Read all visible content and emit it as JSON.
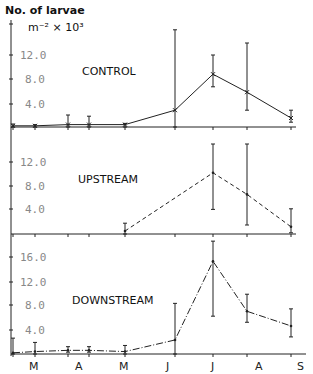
{
  "chart_data": {
    "type": "line",
    "title": "No. of larvae m⁻² × 10³",
    "ylabel_line1": "No. of larvae",
    "ylabel_line2": "m⁻² × 10³",
    "xlabel": "",
    "month_labels": [
      "M",
      "A",
      "M",
      "J",
      "J",
      "A",
      "S"
    ],
    "x_positions": [
      13,
      35,
      68,
      89,
      125,
      175,
      213,
      247,
      291
    ],
    "panels": [
      {
        "name": "CONTROL",
        "line_style": "solid-with-x-markers",
        "yticks": [
          "4.0",
          "8.0",
          "12.0"
        ],
        "ylim": [
          0,
          17
        ],
        "x": [
          0,
          1,
          2,
          3,
          4,
          5,
          6,
          7,
          8
        ],
        "values": [
          0.2,
          0.2,
          0.4,
          0.4,
          0.4,
          2.8,
          8.8,
          5.8,
          1.5
        ],
        "err_low": [
          0.0,
          0.0,
          0.0,
          0.0,
          0.0,
          0.0,
          6.7,
          2.8,
          0.8
        ],
        "err_high": [
          0.5,
          0.4,
          2.0,
          1.8,
          0.6,
          16.2,
          12.0,
          14.0,
          2.8
        ]
      },
      {
        "name": "UPSTREAM",
        "line_style": "dashed",
        "yticks": [
          "4.0",
          "8.0",
          "12.0"
        ],
        "ylim": [
          0,
          16
        ],
        "x": [
          4,
          6,
          7,
          8
        ],
        "values": [
          0.5,
          10.2,
          6.6,
          1.2
        ],
        "err_low": [
          0.0,
          4.1,
          1.5,
          0.2
        ],
        "err_high": [
          1.8,
          15.0,
          15.0,
          4.2
        ]
      },
      {
        "name": "DOWNSTREAM",
        "line_style": "dash-dot",
        "yticks": [
          "4.0",
          "8.0",
          "12.0",
          "16.0"
        ],
        "ylim": [
          0,
          18
        ],
        "x": [
          0,
          1,
          2,
          3,
          4,
          5,
          6,
          7,
          8
        ],
        "values": [
          0.2,
          0.4,
          0.6,
          0.6,
          0.4,
          2.3,
          15.2,
          7.0,
          4.6
        ],
        "err_low": [
          0.0,
          0.0,
          0.3,
          0.3,
          0.0,
          0.0,
          6.2,
          5.2,
          2.8
        ],
        "err_high": [
          2.6,
          1.9,
          1.2,
          1.2,
          1.4,
          8.3,
          18.5,
          9.8,
          7.4
        ]
      }
    ]
  }
}
